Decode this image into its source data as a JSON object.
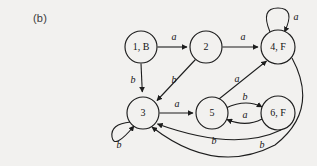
{
  "figure": {
    "label": "(b)",
    "caption_position": "top-left"
  },
  "colors": {
    "background": "#f2f1ef",
    "stroke": "#1d1d1d",
    "text": "#141414"
  },
  "diagram": {
    "type": "state-transition-diagram",
    "alphabet": [
      "a",
      "b"
    ],
    "nodes": [
      {
        "id": "n1",
        "label": "1, B",
        "cx": 141,
        "cy": 47,
        "r": 16
      },
      {
        "id": "n2",
        "label": "2",
        "cx": 206,
        "cy": 47,
        "r": 16
      },
      {
        "id": "n4",
        "label": "4, F",
        "cx": 278,
        "cy": 47,
        "r": 17
      },
      {
        "id": "n3",
        "label": "3",
        "cx": 143,
        "cy": 113,
        "r": 16
      },
      {
        "id": "n5",
        "label": "5",
        "cx": 212,
        "cy": 113,
        "r": 16
      },
      {
        "id": "n6",
        "label": "6, F",
        "cx": 278,
        "cy": 113,
        "r": 17
      }
    ],
    "edges": [
      {
        "id": "e1",
        "from": "1, B",
        "to": "2",
        "label": "a",
        "label_x": 174,
        "label_y": 38
      },
      {
        "id": "e2",
        "from": "2",
        "to": "4, F",
        "label": "a",
        "label_x": 243,
        "label_y": 38
      },
      {
        "id": "e3",
        "from": "1, B",
        "to": "3",
        "label": "b",
        "label_x": 133,
        "label_y": 81
      },
      {
        "id": "e4",
        "from": "2",
        "to": "3",
        "label": "b",
        "label_x": 174,
        "label_y": 81
      },
      {
        "id": "e5",
        "from": "3",
        "to": "5",
        "label": "a",
        "label_x": 177,
        "label_y": 105
      },
      {
        "id": "e6",
        "from": "5",
        "to": "4, F",
        "label": "a",
        "label_x": 238,
        "label_y": 81
      },
      {
        "id": "e7",
        "from": "5",
        "to": "6, F",
        "label": "b",
        "label_x": 245,
        "label_y": 100
      },
      {
        "id": "e8",
        "from": "6, F",
        "to": "5",
        "label": "a",
        "label_x": 245,
        "label_y": 116
      },
      {
        "id": "e9",
        "from": "6, F",
        "to": "3",
        "label": "b",
        "label_x": 214,
        "label_y": 142
      },
      {
        "id": "e10",
        "from": "4, F",
        "to": "3",
        "label": "b",
        "label_x": 261,
        "label_y": 146
      },
      {
        "id": "e11",
        "from": "4, F",
        "to": "4, F",
        "label": "a",
        "label_x": 294,
        "label_y": 18,
        "self_loop": true
      },
      {
        "id": "e12",
        "from": "3",
        "to": "3",
        "label": "b",
        "label_x": 120,
        "label_y": 145,
        "self_loop": true
      }
    ]
  }
}
